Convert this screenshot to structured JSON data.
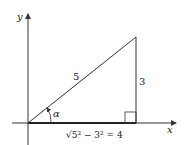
{
  "diagram": {
    "axes": {
      "x_label": "x",
      "y_label": "y"
    },
    "triangle": {
      "hypotenuse_label": "5",
      "opposite_label": "3",
      "angle_label": "α",
      "adjacent_label": "√5² − 3² = 4"
    },
    "colors": {
      "stroke": "#333333",
      "background": "#ffffff"
    }
  }
}
